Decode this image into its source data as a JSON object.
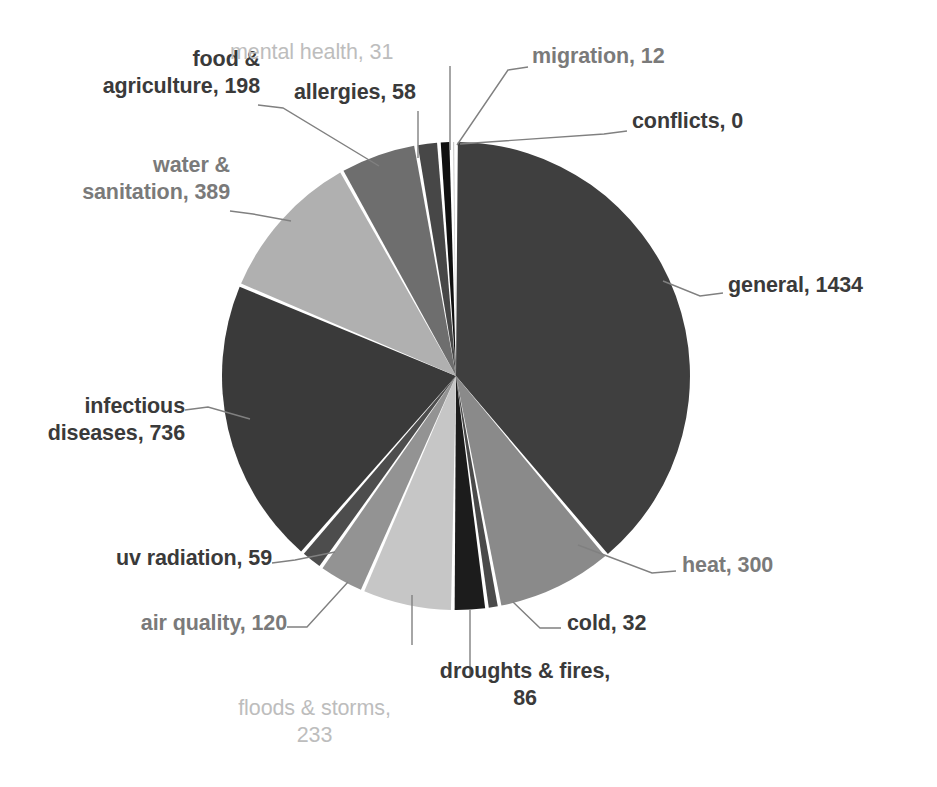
{
  "chart_data": {
    "type": "pie",
    "title": "",
    "subtitle": "",
    "xlabel": "",
    "ylabel": "",
    "legend_position": "none",
    "grid": false,
    "label_format": "category, value",
    "total": 3688,
    "categories": [
      "general",
      "heat",
      "cold",
      "droughts & fires",
      "floods & storms",
      "air quality",
      "uv radiation",
      "infectious diseases",
      "water & sanitation",
      "food & agriculture",
      "allergies",
      "mental health",
      "migration",
      "conflicts"
    ],
    "values": [
      1434,
      300,
      32,
      86,
      233,
      120,
      59,
      736,
      389,
      198,
      58,
      31,
      12,
      0
    ],
    "colors": [
      "#3f3f3f",
      "#8a8a8a",
      "#4a4a4a",
      "#1c1c1c",
      "#c6c6c6",
      "#939393",
      "#4d4d4d",
      "#3a3a3a",
      "#b0b0b0",
      "#6e6e6e",
      "#474747",
      "#101010",
      "#c9c9c9",
      "#3f3f3f"
    ],
    "slices": [
      {
        "label": "general, 1434",
        "category": "general",
        "value": 1434,
        "style": "bold"
      },
      {
        "label": "heat, 300",
        "category": "heat",
        "value": 300,
        "style": "mid"
      },
      {
        "label": "cold, 32",
        "category": "cold",
        "value": 32,
        "style": "bold"
      },
      {
        "label": "droughts & fires,\n86",
        "category": "droughts & fires",
        "value": 86,
        "style": "bold"
      },
      {
        "label": "floods & storms,\n233",
        "category": "floods & storms",
        "value": 233,
        "style": "light"
      },
      {
        "label": "air quality, 120",
        "category": "air quality",
        "value": 120,
        "style": "mid"
      },
      {
        "label": "uv radiation, 59",
        "category": "uv radiation",
        "value": 59,
        "style": "bold"
      },
      {
        "label": "infectious\ndiseases, 736",
        "category": "infectious diseases",
        "value": 736,
        "style": "bold"
      },
      {
        "label": "water &\nsanitation, 389",
        "category": "water & sanitation",
        "value": 389,
        "style": "mid"
      },
      {
        "label": "food &\nagriculture, 198",
        "category": "food & agriculture",
        "value": 198,
        "style": "bold"
      },
      {
        "label": "allergies, 58",
        "category": "allergies",
        "value": 58,
        "style": "bold"
      },
      {
        "label": "mental health, 31",
        "category": "mental health",
        "value": 31,
        "style": "light"
      },
      {
        "label": "migration, 12",
        "category": "migration",
        "value": 12,
        "style": "mid"
      },
      {
        "label": "conflicts, 0",
        "category": "conflicts",
        "value": 0,
        "style": "bold"
      }
    ],
    "geometry": {
      "center_x": 456,
      "center_y": 376,
      "radius": 234,
      "start_angle_deg": -90,
      "direction": "clockwise"
    }
  },
  "labels": {
    "general": "general, 1434",
    "heat": "heat, 300",
    "cold": "cold, 32",
    "droughts_fires": "droughts & fires,\n86",
    "floods_storms": "floods & storms,\n233",
    "air_quality": "air quality, 120",
    "uv_radiation": "uv radiation, 59",
    "infectious_diseases": "infectious\ndiseases, 736",
    "water_sanitation": "water &\nsanitation, 389",
    "food_agriculture": "food &\nagriculture, 198",
    "allergies": "allergies, 58",
    "mental_health": "mental health, 31",
    "migration": "migration, 12",
    "conflicts": "conflicts, 0"
  }
}
